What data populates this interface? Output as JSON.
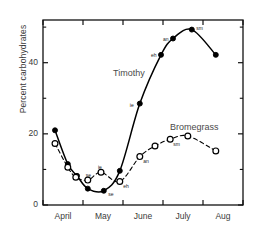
{
  "chart_data": {
    "type": "line",
    "title": "",
    "xlabel": "",
    "ylabel": "Percent carbohydrates",
    "xlim": [
      0,
      5
    ],
    "ylim": [
      0,
      52
    ],
    "yticks_major": [
      0,
      20,
      40
    ],
    "yticks_minor": [
      10,
      30,
      50
    ],
    "xtick_labels": [
      "April",
      "May",
      "June",
      "July",
      "Aug"
    ],
    "grid": false,
    "legend_position": "inline-annotation",
    "series": [
      {
        "name": "Timothy",
        "marker": "filled-circle",
        "linestyle": "solid",
        "color": "#000000",
        "points": [
          {
            "x": 0.3,
            "y": 21.0,
            "label": ""
          },
          {
            "x": 0.62,
            "y": 11.5,
            "label": ""
          },
          {
            "x": 0.85,
            "y": 8.2,
            "label": ""
          },
          {
            "x": 1.12,
            "y": 4.6,
            "label": ""
          },
          {
            "x": 1.52,
            "y": 4.0,
            "label": "se"
          },
          {
            "x": 1.92,
            "y": 9.6,
            "label": ""
          },
          {
            "x": 2.42,
            "y": 28.5,
            "label": "ie"
          },
          {
            "x": 2.95,
            "y": 42.2,
            "label": "eh"
          },
          {
            "x": 3.25,
            "y": 46.8,
            "label": "an"
          },
          {
            "x": 3.72,
            "y": 49.3,
            "label": "sm"
          },
          {
            "x": 4.32,
            "y": 42.2,
            "label": ""
          }
        ]
      },
      {
        "name": "Bromegrass",
        "marker": "open-circle",
        "linestyle": "dashed",
        "color": "#000000",
        "points": [
          {
            "x": 0.3,
            "y": 17.3,
            "label": ""
          },
          {
            "x": 0.62,
            "y": 10.6,
            "label": ""
          },
          {
            "x": 0.82,
            "y": 7.8,
            "label": ""
          },
          {
            "x": 1.12,
            "y": 7.0,
            "label": "se"
          },
          {
            "x": 1.45,
            "y": 9.2,
            "label": "ie"
          },
          {
            "x": 1.92,
            "y": 6.6,
            "label": "eh"
          },
          {
            "x": 2.42,
            "y": 13.6,
            "label": "an"
          },
          {
            "x": 2.8,
            "y": 16.6,
            "label": ""
          },
          {
            "x": 3.18,
            "y": 18.5,
            "label": "sm"
          },
          {
            "x": 3.62,
            "y": 19.4,
            "label": ""
          },
          {
            "x": 4.32,
            "y": 15.2,
            "label": ""
          }
        ]
      }
    ],
    "series_labels": [
      {
        "name": "Timothy",
        "x": 113,
        "y": 68
      },
      {
        "name": "Bromegrass",
        "x": 170,
        "y": 122
      }
    ],
    "point_label_glossary": [
      "se",
      "ie",
      "eh",
      "an",
      "sm"
    ]
  }
}
